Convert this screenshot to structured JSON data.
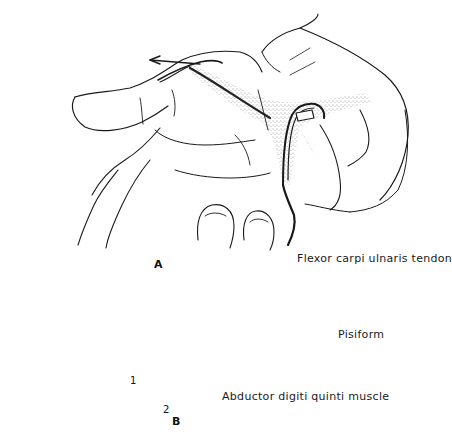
{
  "figure": {
    "panels": [
      {
        "id": "A",
        "label": "A"
      },
      {
        "id": "B",
        "label": "B"
      }
    ],
    "labels": {
      "flexor_carpi_ulnaris_tendon": "Flexor carpi ulnaris tendon",
      "pisiform": "Pisiform",
      "abductor_digiti_quinti_muscle": "Abductor digiti quinti muscle",
      "marker_1": "1",
      "marker_2": "2"
    }
  }
}
